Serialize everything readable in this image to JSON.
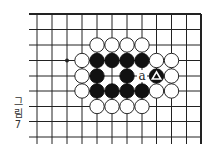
{
  "diagram": {
    "type": "go-board-fragment",
    "caption": {
      "line1": "그",
      "line2": "림",
      "line3": "7"
    },
    "colors": {
      "line": "#222222",
      "black_stone": "#111111",
      "white_stone": "#ffffff",
      "background": "#ffffff"
    },
    "grid": {
      "columns_x": [
        37,
        52,
        67,
        82,
        97,
        112,
        127,
        142,
        156.5,
        171.5,
        186.5,
        201
      ],
      "rows_y": [
        14,
        29.5,
        45,
        60.5,
        76,
        91,
        106.5,
        121.5,
        137
      ],
      "line_left_start": 29,
      "vertical_bottom_end": 144,
      "top_edge_thick": true,
      "right_edge_thick": true
    },
    "star_points": [
      {
        "col": 2,
        "row": 3
      }
    ],
    "stones": [
      {
        "color": "white",
        "col": 4,
        "row": 2
      },
      {
        "color": "white",
        "col": 5,
        "row": 2
      },
      {
        "color": "white",
        "col": 6,
        "row": 2
      },
      {
        "color": "white",
        "col": 7,
        "row": 2
      },
      {
        "color": "white",
        "col": 3,
        "row": 3
      },
      {
        "color": "black",
        "col": 4,
        "row": 3
      },
      {
        "color": "black",
        "col": 5,
        "row": 3
      },
      {
        "color": "black",
        "col": 6,
        "row": 3
      },
      {
        "color": "black",
        "col": 7,
        "row": 3
      },
      {
        "color": "white",
        "col": 8,
        "row": 3
      },
      {
        "color": "white",
        "col": 9,
        "row": 3
      },
      {
        "color": "white",
        "col": 3,
        "row": 4
      },
      {
        "color": "black",
        "col": 4,
        "row": 4
      },
      {
        "color": "black",
        "col": 6,
        "row": 4
      },
      {
        "color": "black",
        "col": 8,
        "row": 4,
        "marker": "triangle"
      },
      {
        "color": "white",
        "col": 9,
        "row": 4
      },
      {
        "color": "white",
        "col": 3,
        "row": 5
      },
      {
        "color": "black",
        "col": 4,
        "row": 5
      },
      {
        "color": "black",
        "col": 5,
        "row": 5
      },
      {
        "color": "black",
        "col": 6,
        "row": 5
      },
      {
        "color": "black",
        "col": 7,
        "row": 5
      },
      {
        "color": "white",
        "col": 8,
        "row": 5
      },
      {
        "color": "white",
        "col": 9,
        "row": 5
      },
      {
        "color": "white",
        "col": 4,
        "row": 6
      },
      {
        "color": "white",
        "col": 5,
        "row": 6
      },
      {
        "color": "white",
        "col": 6,
        "row": 6
      },
      {
        "color": "white",
        "col": 7,
        "row": 6
      }
    ],
    "labels": [
      {
        "text": "a",
        "col": 7,
        "row": 4
      }
    ]
  }
}
